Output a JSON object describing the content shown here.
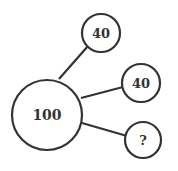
{
  "diagram": {
    "center": {
      "label": "100"
    },
    "nodes": [
      {
        "label": "40"
      },
      {
        "label": "40"
      },
      {
        "label": "?"
      }
    ],
    "colors": {
      "stroke": "#333333",
      "background": "#ffffff"
    }
  }
}
